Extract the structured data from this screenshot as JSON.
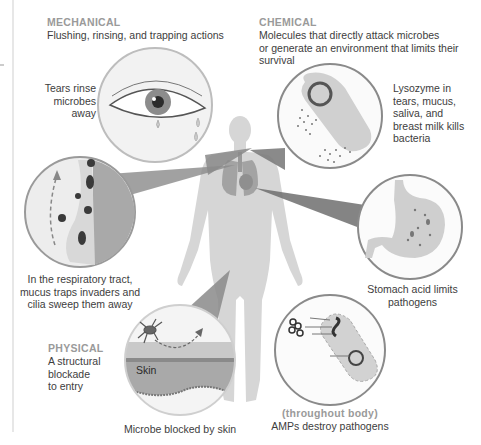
{
  "mechanical": {
    "category": "MECHANICAL",
    "description": "Flushing, rinsing, and trapping actions"
  },
  "chemical": {
    "category": "CHEMICAL",
    "description_lines": [
      "Molecules that directly attack microbes",
      "or generate an environment that limits their",
      "survival"
    ]
  },
  "physical": {
    "category": "PHYSICAL",
    "description_lines": [
      "A structural",
      "blockade",
      "to entry"
    ]
  },
  "callouts": {
    "tears": [
      "Tears rinse",
      "microbes",
      "away"
    ],
    "lysozyme": [
      "Lysozyme in",
      "tears, mucus,",
      "saliva, and",
      "breast milk kills",
      "bacteria"
    ],
    "respiratory": [
      "In the respiratory tract,",
      "mucus traps invaders and",
      "cilia sweep them away"
    ],
    "stomach": [
      "Stomach acid limits",
      "pathogens"
    ],
    "skin": {
      "inner_label": "Skin",
      "caption": "Microbe blocked by skin"
    },
    "amps": {
      "location": "(throughout body)",
      "caption": "AMPs destroy pathogens"
    }
  },
  "colors": {
    "category_label": "#9a9a9a",
    "body_text": "#3d3d3d",
    "silhouette": "#d4d4d4",
    "organ": "#a8a8a8",
    "wedge": "#8a8a8a",
    "circle_border": "#7a7a7a",
    "divider": "#cfcfcf"
  }
}
